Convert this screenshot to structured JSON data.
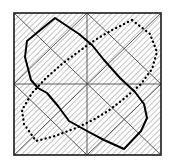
{
  "figure": {
    "canvas": {
      "width": 170,
      "height": 167,
      "background": "#ffffff"
    },
    "colors": {
      "frame": "#1a1a1a",
      "grid": "#4a4a4a",
      "hatch": "#555555",
      "solid_curve": "#000000",
      "dotted_curve": "#000000"
    },
    "frame": {
      "name": "outer-square",
      "x": 14,
      "y": 13,
      "width": 147,
      "height": 142,
      "stroke_width": 1.6
    },
    "grid": {
      "name": "midlines-and-diamond",
      "stroke_width": 0.9,
      "horizontal_midline_y": 84,
      "vertical_midline_x": 87,
      "diamond_points": "87,13 161,84 87,155 14,84",
      "diagonal_a": "14,13 161,155",
      "diagonal_b": "161,13 14,155"
    },
    "hatch": {
      "name": "diagonal-hatch-fill",
      "angle_deg": 45,
      "spacing": 4,
      "stroke_width": 0.7,
      "regions": [
        {
          "name": "hatch-region-upper-left-triangle",
          "points": "14,13 87,13 14,84"
        },
        {
          "name": "hatch-region-left-lower-triangle",
          "points": "14,84 87,155 14,155"
        },
        {
          "name": "hatch-region-center-left-diamond",
          "points": "87,13 161,84 87,155 14,84"
        },
        {
          "name": "hatch-region-upper-right-triangle",
          "points": "87,13 161,13 161,84"
        },
        {
          "name": "hatch-region-lower-right-triangle",
          "points": "161,84 161,155 87,155"
        }
      ]
    },
    "solid_polygon": {
      "name": "solid-outline-polygon",
      "stroke_width": 2.0,
      "style": "solid",
      "points": [
        [
          55,
          18
        ],
        [
          27,
          41
        ],
        [
          25,
          57
        ],
        [
          31,
          80
        ],
        [
          38,
          88
        ],
        [
          47,
          93
        ],
        [
          58,
          106
        ],
        [
          69,
          121
        ],
        [
          87,
          131
        ],
        [
          104,
          140
        ],
        [
          124,
          149
        ],
        [
          141,
          131
        ],
        [
          147,
          118
        ],
        [
          144,
          104
        ],
        [
          135,
          92
        ],
        [
          120,
          78
        ],
        [
          104,
          60
        ],
        [
          92,
          45
        ],
        [
          79,
          34
        ]
      ]
    },
    "dotted_polygon": {
      "name": "dotted-outline-polygon",
      "stroke_width": 2.3,
      "style": "dotted",
      "dash_pattern": "0.2 4.2",
      "points": [
        [
          132,
          20
        ],
        [
          112,
          30
        ],
        [
          95,
          40
        ],
        [
          78,
          52
        ],
        [
          62,
          64
        ],
        [
          46,
          78
        ],
        [
          32,
          93
        ],
        [
          22,
          110
        ],
        [
          24,
          124
        ],
        [
          36,
          141
        ],
        [
          55,
          136
        ],
        [
          76,
          128
        ],
        [
          93,
          120
        ],
        [
          108,
          111
        ],
        [
          125,
          98
        ],
        [
          141,
          84
        ],
        [
          152,
          69
        ],
        [
          157,
          52
        ],
        [
          150,
          34
        ]
      ]
    }
  }
}
